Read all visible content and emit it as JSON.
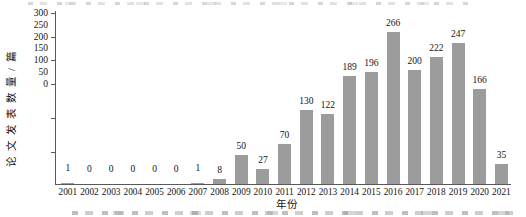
{
  "chart_data": {
    "type": "bar",
    "title": "",
    "xlabel": "年份",
    "ylabel": "论文发表数量/篇",
    "categories": [
      "2001",
      "2002",
      "2003",
      "2004",
      "2005",
      "2006",
      "2007",
      "2008",
      "2009",
      "2010",
      "2011",
      "2012",
      "2013",
      "2014",
      "2015",
      "2016",
      "2017",
      "2018",
      "2019",
      "2020",
      "2021"
    ],
    "values": [
      1,
      0,
      0,
      0,
      0,
      0,
      1,
      8,
      50,
      27,
      70,
      130,
      122,
      189,
      196,
      266,
      200,
      222,
      247,
      166,
      35
    ],
    "y_ticks": [
      300,
      250,
      200,
      150,
      100,
      50,
      0
    ],
    "ylim": [
      0,
      300
    ],
    "grid": false,
    "legend": "none",
    "value_labels_shown": true,
    "bar_color": "#9c9c9c",
    "axis_color": "#595959",
    "text_color": "#141414"
  }
}
